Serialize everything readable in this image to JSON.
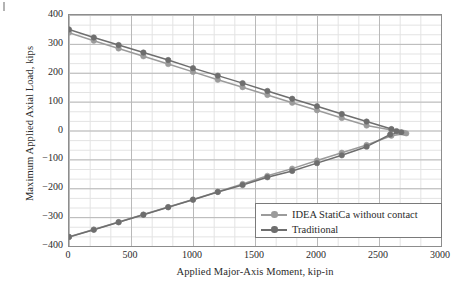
{
  "chart_data": {
    "type": "line",
    "title": "",
    "xlabel": "Applied Major-Axis Moment, kip-in",
    "ylabel": "Maximum Applied Axial Load, kips",
    "xlim": [
      0,
      3000
    ],
    "ylim": [
      -400,
      400
    ],
    "xticks": [
      0,
      500,
      1000,
      1500,
      2000,
      2500,
      3000
    ],
    "yticks": [
      400,
      300,
      200,
      100,
      0,
      -100,
      -200,
      -300,
      -400
    ],
    "xtick_labels": [
      "0",
      "500",
      "1000",
      "1500",
      "2000",
      "2500",
      "3000"
    ],
    "ytick_labels": [
      "400",
      "300",
      "200",
      "100",
      "0",
      "−100",
      "−200",
      "−300",
      "−400"
    ],
    "grid": true,
    "minor_grid": true,
    "minor_ticks_per_major": 2,
    "legend_position": "lower right",
    "series": [
      {
        "name": "IDEA StatiCa without contact",
        "color": "#9b9b9b",
        "marker": "circle",
        "points": [
          [
            0,
            339
          ],
          [
            200,
            311
          ],
          [
            400,
            284
          ],
          [
            600,
            257
          ],
          [
            800,
            230
          ],
          [
            1000,
            203
          ],
          [
            1200,
            176
          ],
          [
            1400,
            150
          ],
          [
            1600,
            123
          ],
          [
            1800,
            96
          ],
          [
            2000,
            70
          ],
          [
            2200,
            43
          ],
          [
            2400,
            17
          ],
          [
            2600,
            2
          ],
          [
            2650,
            -4
          ],
          [
            2700,
            -8
          ],
          [
            2720,
            -10
          ],
          [
            2600,
            -18
          ],
          [
            2400,
            -50
          ],
          [
            2200,
            -77
          ],
          [
            2000,
            -104
          ],
          [
            1800,
            -132
          ],
          [
            1600,
            -157
          ],
          [
            1400,
            -185
          ],
          [
            1200,
            -212
          ],
          [
            1000,
            -239
          ],
          [
            800,
            -265
          ],
          [
            600,
            -291
          ],
          [
            400,
            -317
          ],
          [
            200,
            -343
          ],
          [
            0,
            -368
          ]
        ]
      },
      {
        "name": "Traditional",
        "color": "#6e6e6e",
        "marker": "circle",
        "points": [
          [
            0,
            350
          ],
          [
            200,
            322
          ],
          [
            400,
            296
          ],
          [
            600,
            270
          ],
          [
            800,
            244
          ],
          [
            1000,
            216
          ],
          [
            1200,
            190
          ],
          [
            1400,
            164
          ],
          [
            1600,
            137
          ],
          [
            1800,
            110
          ],
          [
            2000,
            84
          ],
          [
            2200,
            57
          ],
          [
            2400,
            31
          ],
          [
            2600,
            5
          ],
          [
            2640,
            -2
          ],
          [
            2680,
            -6
          ],
          [
            2590,
            -14
          ],
          [
            2400,
            -56
          ],
          [
            2200,
            -86
          ],
          [
            2000,
            -113
          ],
          [
            1800,
            -140
          ],
          [
            1600,
            -162
          ],
          [
            1400,
            -189
          ],
          [
            1200,
            -213
          ],
          [
            1000,
            -240
          ],
          [
            800,
            -266
          ],
          [
            600,
            -292
          ],
          [
            400,
            -318
          ],
          [
            200,
            -344
          ],
          [
            0,
            -369
          ]
        ]
      }
    ]
  },
  "legend": {
    "items": [
      {
        "label": "IDEA StatiCa without contact",
        "color": "#9b9b9b"
      },
      {
        "label": "Traditional",
        "color": "#6e6e6e"
      }
    ]
  },
  "axes": {
    "y_title": "Maximum Applied Axial Load, kips",
    "x_title": "Applied Major-Axis Moment, kip-in"
  }
}
